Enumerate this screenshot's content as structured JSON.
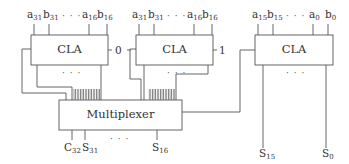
{
  "diagram": {
    "blocks": [
      {
        "id": "cla_upper_c0",
        "label": "CLA",
        "carry_in": "0",
        "inputs": [
          "a31",
          "b31",
          "...",
          "a16",
          "b16"
        ]
      },
      {
        "id": "cla_upper_c1",
        "label": "CLA",
        "carry_in": "1",
        "inputs": [
          "a31",
          "b31",
          "...",
          "a16",
          "b16"
        ]
      },
      {
        "id": "cla_lower",
        "label": "CLA",
        "inputs": [
          "a15",
          "b15",
          "...",
          "a0",
          "b0"
        ]
      }
    ],
    "mux": {
      "label": "Multiplexer"
    },
    "outputs": {
      "mux": [
        "C32",
        "S31",
        "...",
        "S16"
      ],
      "lower": [
        "S15",
        "...",
        "S0"
      ]
    },
    "labels": {
      "cla1": {
        "a_hi": "a",
        "a_hi_sub": "31",
        "b_hi": "b",
        "b_hi_sub": "31",
        "dots": "· · ·",
        "a_lo": "a",
        "a_lo_sub": "16",
        "b_lo": "b",
        "b_lo_sub": "16"
      },
      "cla2": {
        "a_hi": "a",
        "a_hi_sub": "31",
        "b_hi": "b",
        "b_hi_sub": "31",
        "dots": "· · ·",
        "a_lo": "a",
        "a_lo_sub": "16",
        "b_lo": "b",
        "b_lo_sub": "16"
      },
      "cla3": {
        "a_hi": "a",
        "a_hi_sub": "15",
        "b_hi": "b",
        "b_hi_sub": "15",
        "dots": "· · ·",
        "a_lo": "a",
        "a_lo_sub": "0",
        "b_lo": "b",
        "b_lo_sub": "0"
      },
      "cla_text": "CLA",
      "carry0": "0",
      "carry1": "1",
      "inner_dots": "· · ·",
      "mux_text": "Multiplexer",
      "c32": "C",
      "c32_sub": "32",
      "s31": "S",
      "s31_sub": "31",
      "s16": "S",
      "s16_sub": "16",
      "s15": "S",
      "s15_sub": "15",
      "s0": "S",
      "s0_sub": "0",
      "out_dots": "· · ·"
    }
  }
}
